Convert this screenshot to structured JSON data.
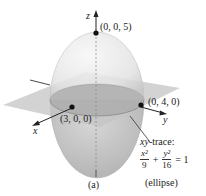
{
  "figure": {
    "panel_label": "(a)",
    "axes": {
      "x": "x",
      "y": "y",
      "z": "z"
    },
    "points": [
      {
        "id": "z-intercept",
        "label": "(0, 0, 5)"
      },
      {
        "id": "x-intercept",
        "label": "(3, 0, 0)"
      },
      {
        "id": "y-intercept",
        "label": "(0, 4, 0)"
      }
    ],
    "trace": {
      "title_var": "xy",
      "title_rest": "-trace:",
      "equation": {
        "term1_num": "x²",
        "term1_den": "9",
        "plus": "+",
        "term2_num": "y²",
        "term2_den": "16",
        "equals": "= 1"
      },
      "shape": "(ellipse)"
    },
    "colors": {
      "ellipsoid": "#e6e6e6",
      "plane": "#bdbdbd",
      "trace_fill": "#9e9e9e",
      "axis": "#222222"
    }
  }
}
